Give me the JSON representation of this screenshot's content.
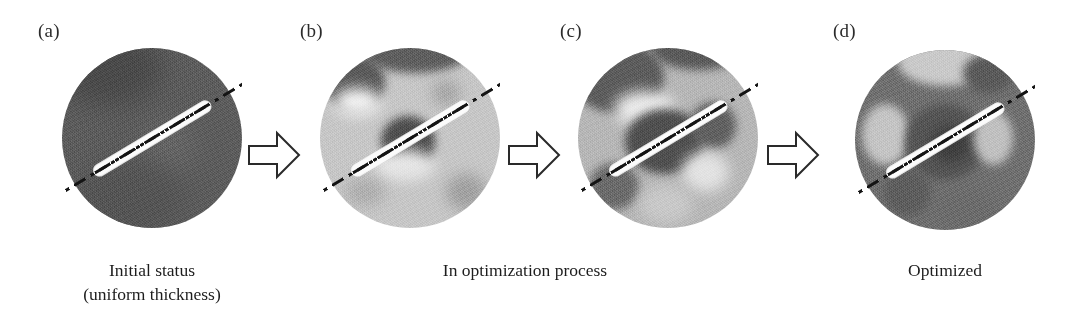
{
  "figure": {
    "background_color": "#ffffff",
    "ink_color": "#1a1a1a"
  },
  "panels": [
    {
      "label": "(a)",
      "name": "panel-a",
      "stage_description": "Uniform dark thickness disc, smooth circular boundary",
      "base_gray": "#5a5a5a",
      "has_centerline": true
    },
    {
      "label": "(b)",
      "name": "panel-b",
      "stage_description": "Light disc with dark patch upper-left and dark core at centre",
      "base_gray": "#c6c6c6",
      "has_centerline": true
    },
    {
      "label": "(c)",
      "name": "panel-c",
      "stage_description": "Mottled disc with large dark core and several dark lobes",
      "base_gray": "#b4b4b4",
      "has_centerline": true
    },
    {
      "label": "(d)",
      "name": "panel-d",
      "stage_description": "Optimized dark disc with bright speckled ribs forming a diamond rib pattern",
      "base_gray": "#6e6e6e",
      "has_centerline": true
    }
  ],
  "arrows": [
    {
      "name": "arrow-a-to-b",
      "direction": "right",
      "style": "hollow-block-outline"
    },
    {
      "name": "arrow-b-to-c",
      "direction": "right",
      "style": "hollow-block-outline"
    },
    {
      "name": "arrow-c-to-d",
      "direction": "right",
      "style": "hollow-block-outline"
    }
  ],
  "captions": [
    {
      "name": "caption-initial",
      "text": "Initial status\n(uniform thickness)",
      "spans_panels": [
        "(a)"
      ]
    },
    {
      "name": "caption-in-process",
      "text": "In optimization process",
      "spans_panels": [
        "(b)",
        "(c)"
      ]
    },
    {
      "name": "caption-optimized",
      "text": "Optimized",
      "spans_panels": [
        "(d)"
      ]
    }
  ],
  "centerline": {
    "name": "section-centerline",
    "style": "dash-dot",
    "color": "#141414",
    "halo_color": "#fbfbfb",
    "angle_degrees": -31
  }
}
